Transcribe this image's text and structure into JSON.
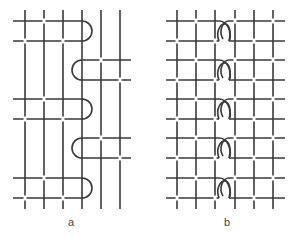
{
  "figure": {
    "stroke_color": "#3a3a3a",
    "stroke_width": 1.6,
    "panels": [
      {
        "id": "a",
        "label": "a",
        "label_pos": [
          71,
          226
        ],
        "verticals": [
          25,
          44,
          63,
          82,
          101,
          120
        ],
        "vertical_span": [
          10,
          209
        ],
        "rows": [
          {
            "y1": 21,
            "y2": 41,
            "side": "right",
            "x_start": 13,
            "x_end": 82
          },
          {
            "y1": 60,
            "y2": 80,
            "side": "left",
            "x_start": 82,
            "x_end": 131
          },
          {
            "y1": 99,
            "y2": 119,
            "side": "right",
            "x_start": 13,
            "x_end": 82
          },
          {
            "y1": 138,
            "y2": 158,
            "side": "left",
            "x_start": 82,
            "x_end": 131
          },
          {
            "y1": 178,
            "y2": 198,
            "side": "right",
            "x_start": 13,
            "x_end": 82
          }
        ]
      },
      {
        "id": "b",
        "label": "b",
        "label_pos": [
          227,
          226
        ],
        "verticals": [
          177,
          196,
          215,
          235,
          254,
          273
        ],
        "vertical_span": [
          10,
          209
        ],
        "x_start": 166,
        "x_end": 285,
        "loop_x": 225,
        "rows": [
          {
            "y1": 21,
            "y2": 41
          },
          {
            "y1": 60,
            "y2": 80
          },
          {
            "y1": 99,
            "y2": 119
          },
          {
            "y1": 138,
            "y2": 158
          },
          {
            "y1": 178,
            "y2": 198
          }
        ]
      }
    ]
  }
}
